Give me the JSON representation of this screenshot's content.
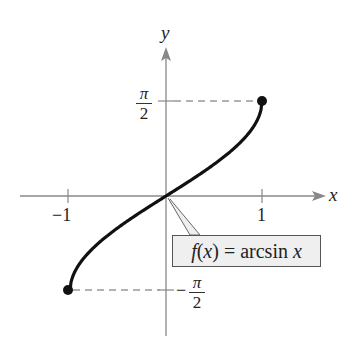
{
  "chart_data": {
    "type": "line",
    "title": "",
    "function_label": "f(x) = arcsin x",
    "xlabel": "x",
    "ylabel": "y",
    "x_ticks": [
      {
        "value": -1,
        "label": "−1"
      },
      {
        "value": 1,
        "label": "1"
      }
    ],
    "y_ticks": [
      {
        "value": 1.5708,
        "label": "π/2"
      },
      {
        "value": -1.5708,
        "label": "−π/2"
      }
    ],
    "domain": [
      -1,
      1
    ],
    "range": [
      -1.5708,
      1.5708
    ],
    "endpoints": [
      {
        "x": -1,
        "y": -1.5708,
        "filled": true
      },
      {
        "x": 1,
        "y": 1.5708,
        "filled": true
      }
    ],
    "x": [
      -1,
      -0.9,
      -0.75,
      -0.5,
      -0.25,
      0,
      0.25,
      0.5,
      0.75,
      0.9,
      1
    ],
    "y": [
      -1.5708,
      -1.1198,
      -0.8481,
      -0.5236,
      -0.2527,
      0,
      0.2527,
      0.5236,
      0.8481,
      1.1198,
      1.5708
    ],
    "grid": false,
    "guide_lines": "dashed horizontal lines from y-axis to endpoints"
  },
  "labels": {
    "x_axis": "x",
    "y_axis": "y",
    "tick_neg1": "−1",
    "tick_pos1": "1",
    "pi": "π",
    "two": "2",
    "minus": "−",
    "f_prefix": "f",
    "f_paren_open": "(",
    "f_var": "x",
    "f_paren_close": ")",
    "f_eq": " = arcsin ",
    "f_var2": "x"
  }
}
